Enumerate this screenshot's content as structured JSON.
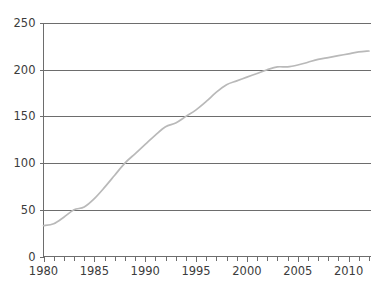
{
  "chart_data": {
    "type": "line",
    "title": "",
    "subtitle": "",
    "xlabel": "",
    "ylabel": "",
    "xlim": [
      1980,
      2012.2
    ],
    "ylim": [
      0,
      250
    ],
    "grid": true,
    "grid_axis": "y",
    "legend": false,
    "legend_position": "none",
    "annotations": [],
    "colors": {
      "line": "#b9b9b9",
      "grid": "#6d6d6d",
      "axis": "#6d6d6d",
      "text": "#3c3c3c",
      "background": "#ffffff"
    },
    "y_ticks": [
      0,
      50,
      100,
      150,
      200,
      250
    ],
    "y_tick_labels": [
      "0",
      "50",
      "100",
      "150",
      "200",
      "250"
    ],
    "x_ticks": [
      1980,
      1981,
      1982,
      1983,
      1984,
      1985,
      1986,
      1987,
      1988,
      1989,
      1990,
      1991,
      1992,
      1993,
      1994,
      1995,
      1996,
      1997,
      1998,
      1999,
      2000,
      2001,
      2002,
      2003,
      2004,
      2005,
      2006,
      2007,
      2008,
      2009,
      2010,
      2011,
      2012
    ],
    "x_tick_labels": [
      "1980",
      "1985",
      "1990",
      "1995",
      "2000",
      "2005",
      "2010"
    ],
    "x_labeled_ticks": [
      1980,
      1985,
      1990,
      1995,
      2000,
      2005,
      2010
    ],
    "series": [
      {
        "name": "series-1",
        "color": "#b9b9b9",
        "x": [
          1980,
          1981,
          1982,
          1983,
          1984,
          1985,
          1986,
          1987,
          1988,
          1989,
          1990,
          1991,
          1992,
          1993,
          1994,
          1995,
          1996,
          1997,
          1998,
          1999,
          2000,
          2001,
          2002,
          2003,
          2004,
          2005,
          2006,
          2007,
          2008,
          2009,
          2010,
          2011,
          2012
        ],
        "values": [
          33,
          35,
          42,
          50,
          53,
          62,
          74,
          87,
          100,
          110,
          120,
          130,
          139,
          143,
          150,
          157,
          166,
          176,
          184,
          188,
          192,
          196,
          200,
          203,
          203,
          205,
          208,
          211,
          213,
          215,
          217,
          219,
          220
        ]
      }
    ]
  },
  "axes": {
    "y_axis_name": "value-axis",
    "x_axis_name": "year-axis"
  }
}
